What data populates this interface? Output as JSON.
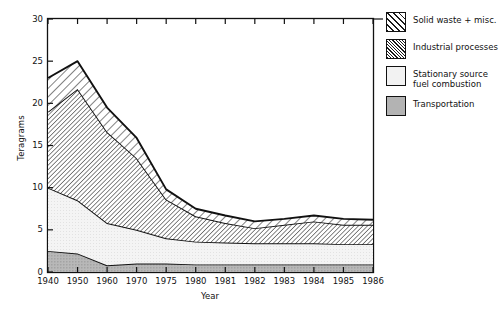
{
  "chart_data": {
    "type": "area",
    "stacked": true,
    "title": "",
    "xlabel": "Year",
    "ylabel": "Teragrams",
    "categories": [
      "1940",
      "1950",
      "1960",
      "1970",
      "1975",
      "1980",
      "1981",
      "1982",
      "1983",
      "1984",
      "1985",
      "1986"
    ],
    "x": [
      1940,
      1950,
      1960,
      1970,
      1975,
      1980,
      1981,
      1982,
      1983,
      1984,
      1985,
      1986
    ],
    "ylim": [
      0,
      30
    ],
    "xlim_note": "categorical even spacing",
    "yticks": [
      0,
      5,
      10,
      15,
      20,
      25,
      30
    ],
    "ytick_labels": [
      "0",
      "5",
      "10",
      "15",
      "20",
      "25",
      "30"
    ],
    "grid": false,
    "legend_position": "right",
    "series": [
      {
        "name": "Transportation",
        "fill": "solid-gray",
        "values": [
          2.5,
          2.2,
          0.8,
          1.0,
          1.0,
          0.9,
          0.9,
          0.9,
          0.9,
          0.9,
          0.9,
          0.9
        ]
      },
      {
        "name": "Stationary source fuel combustion",
        "fill": "light-gray",
        "values": [
          7.5,
          6.3,
          5.0,
          4.0,
          3.0,
          2.7,
          2.6,
          2.5,
          2.5,
          2.5,
          2.4,
          2.4
        ]
      },
      {
        "name": "Industrial processes",
        "fill": "dense-hatch",
        "values": [
          9.0,
          13.2,
          10.8,
          8.5,
          4.6,
          3.0,
          2.3,
          1.8,
          2.2,
          2.6,
          2.3,
          2.3
        ]
      },
      {
        "name": "Solid waste + misc.",
        "fill": "sparse-hatch",
        "values": [
          4.0,
          3.3,
          2.9,
          2.4,
          1.2,
          0.9,
          0.9,
          0.8,
          0.7,
          0.7,
          0.7,
          0.6
        ]
      }
    ],
    "cumulative_tops": {
      "transportation": [
        2.5,
        2.2,
        0.8,
        1.0,
        1.0,
        0.9,
        0.9,
        0.9,
        0.9,
        0.9,
        0.9,
        0.9
      ],
      "stationary": [
        10.0,
        8.5,
        5.8,
        5.0,
        4.0,
        3.6,
        3.5,
        3.4,
        3.4,
        3.4,
        3.3,
        3.3
      ],
      "industrial": [
        19.0,
        21.7,
        16.6,
        13.5,
        8.6,
        6.6,
        5.8,
        5.2,
        5.6,
        6.0,
        5.6,
        5.6
      ],
      "solid_waste_total": [
        23.0,
        25.0,
        19.5,
        15.9,
        9.8,
        7.5,
        6.7,
        6.0,
        6.3,
        6.7,
        6.3,
        6.2
      ]
    }
  },
  "axes": {
    "ylabel": "Teragrams",
    "xlabel": "Year",
    "ytick_labels": [
      "30",
      "25",
      "20",
      "15",
      "10",
      "5",
      "0"
    ],
    "xtick_labels": [
      "1940",
      "1950",
      "1960",
      "1970",
      "1975",
      "1980",
      "1981",
      "1982",
      "1983",
      "1984",
      "1985",
      "1986"
    ]
  },
  "legend": {
    "items": [
      {
        "label": "Solid waste + misc.",
        "swatch": "sparse-hatch"
      },
      {
        "label": "Industrial processes",
        "swatch": "dense-hatch"
      },
      {
        "label": "Stationary source\nfuel combustion",
        "swatch": "light-gray"
      },
      {
        "label": "Transportation",
        "swatch": "solid-gray"
      }
    ]
  },
  "colors": {
    "axis": "#111111",
    "transportation": "#b3b3b3",
    "stationary": "#f2f2f2",
    "hatch": "#1a1a1a",
    "background": "#ffffff"
  }
}
